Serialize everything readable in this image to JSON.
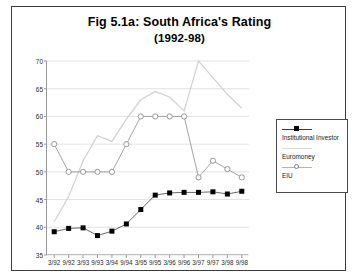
{
  "figure": {
    "title_line1": "Fig 5.1a: South Africa's Rating",
    "title_line2": "(1992-98)"
  },
  "legend": {
    "position": "right",
    "items": [
      {
        "label": "Institutional Investor",
        "marker": "filled-square",
        "color": "#000000"
      },
      {
        "label": "Euromoney",
        "marker": "none",
        "color": "#d0d0d0"
      },
      {
        "label": "EIU",
        "marker": "open-circle",
        "color": "#8c8c8c"
      }
    ]
  },
  "chart_data": {
    "type": "line",
    "title": "Fig 5.1a: South Africa's Rating (1992-98)",
    "xlabel": "",
    "ylabel": "",
    "grid": true,
    "legend_position": "right",
    "ylim": [
      35,
      70
    ],
    "yticks": [
      35,
      40,
      45,
      50,
      55,
      60,
      65,
      70
    ],
    "categories": [
      "3/92",
      "9/92",
      "3/93",
      "9/93",
      "3/94",
      "9/94",
      "3/95",
      "9/95",
      "3/96",
      "9/96",
      "3/97",
      "9/97",
      "3/98",
      "9/98"
    ],
    "series": [
      {
        "name": "Institutional Investor",
        "color": "#000000",
        "marker": "filled-square",
        "values": [
          39.2,
          39.8,
          39.9,
          38.5,
          39.3,
          40.6,
          43.2,
          45.8,
          46.2,
          46.3,
          46.3,
          46.4,
          46.0,
          46.5
        ]
      },
      {
        "name": "Euromoney",
        "color": "#d0d0d0",
        "marker": "none",
        "values": [
          41.0,
          45.5,
          52.0,
          56.5,
          55.5,
          59.5,
          63.0,
          64.5,
          63.5,
          61.0,
          70.0,
          67.0,
          64.0,
          61.5
        ]
      },
      {
        "name": "EIU",
        "color": "#8c8c8c",
        "marker": "open-circle",
        "values": [
          55.0,
          50.0,
          50.0,
          50.0,
          50.0,
          55.0,
          60.0,
          60.0,
          60.0,
          60.0,
          49.0,
          52.0,
          50.5,
          49.0
        ]
      }
    ]
  }
}
